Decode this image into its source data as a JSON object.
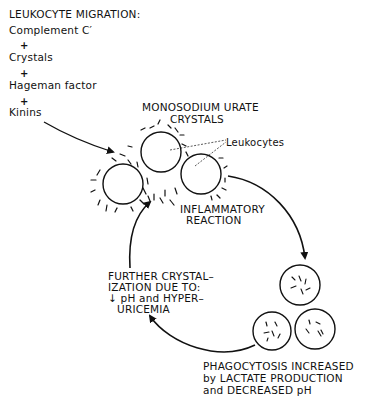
{
  "left_list": {
    "title": "LEUKOCYTE MIGRATION:",
    "items": [
      "Complement C′",
      "Crystals",
      "Hageman factor",
      "Kinins"
    ],
    "separator": "+"
  },
  "crystal_label": {
    "line1": "MONOSODIUM URATE",
    "line2": "CRYSTALS"
  },
  "leukocytes_label": "Leukocytes",
  "inflammatory_label": {
    "line1": "INFLAMMATORY",
    "line2": "REACTION"
  },
  "further_label": {
    "line1": "FURTHER CRYSTAL–",
    "line2": "IZATION DUE TO:",
    "line3": "↓ pH and HYPER–",
    "line4": "URICEMIA"
  },
  "phagocytosis_label": {
    "line1": "PHAGOCYTOSIS INCREASED",
    "line2": "by LACTATE PRODUCTION",
    "line3": "and DECREASED pH"
  },
  "colors": {
    "ink": "#111111",
    "background": "#ffffff"
  }
}
